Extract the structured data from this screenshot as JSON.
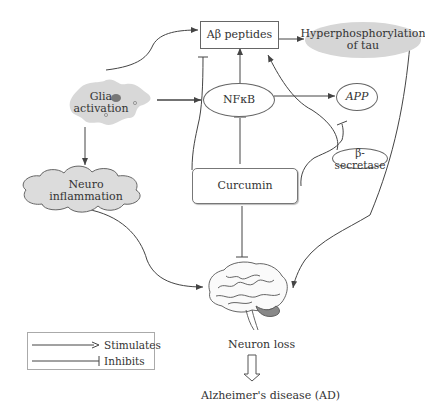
{
  "nodes": {
    "abeta": "Aβ peptides",
    "hyper": {
      "line1": "Hyperphosphorylation",
      "line2": "of tau"
    },
    "glia": {
      "line1": "Glia",
      "line2": "activation"
    },
    "nfkb": "NFκB",
    "app": "APP",
    "bsec": "β-secretase",
    "neuroinf": {
      "line1": "Neuro",
      "line2": "inflammation"
    },
    "curcumin": "Curcumin",
    "neuron_loss": "Neuron loss",
    "ad": "Alzheimer's disease (AD)"
  },
  "legend": {
    "stimulates": "Stimulates",
    "inhibits": "Inhibits"
  },
  "edges": [
    {
      "from": "Glia activation",
      "to": "Aβ peptides",
      "type": "stimulates"
    },
    {
      "from": "Glia activation",
      "to": "NFκB",
      "type": "stimulates"
    },
    {
      "from": "Glia activation",
      "to": "Neuro inflammation",
      "type": "stimulates"
    },
    {
      "from": "NFκB",
      "to": "Aβ peptides",
      "type": "stimulates"
    },
    {
      "from": "NFκB",
      "to": "APP",
      "type": "stimulates"
    },
    {
      "from": "Aβ peptides",
      "to": "Hyperphosphorylation of tau",
      "type": "stimulates"
    },
    {
      "from": "Hyperphosphorylation of tau",
      "to": "Neuron loss",
      "type": "stimulates"
    },
    {
      "from": "Neuro inflammation",
      "to": "Neuron loss",
      "type": "stimulates"
    },
    {
      "from": "β-secretase",
      "to": "Aβ peptides",
      "type": "stimulates"
    },
    {
      "from": "Curcumin",
      "to": "NFκB",
      "type": "inhibits"
    },
    {
      "from": "Curcumin",
      "to": "Aβ peptides",
      "type": "inhibits"
    },
    {
      "from": "Curcumin",
      "to": "β-secretase",
      "type": "inhibits"
    },
    {
      "from": "Curcumin",
      "to": "Neuron loss",
      "type": "inhibits"
    },
    {
      "from": "Neuron loss",
      "to": "Alzheimer's disease (AD)",
      "type": "leads-to"
    }
  ]
}
